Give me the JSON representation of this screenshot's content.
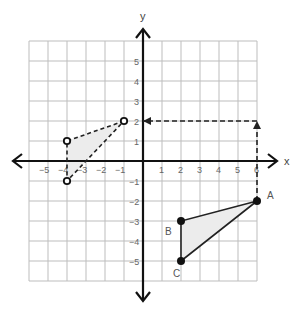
{
  "diagram": {
    "type": "coordinate-plane-translation",
    "axes": {
      "x_label": "x",
      "y_label": "y",
      "x_range": [
        -6,
        6
      ],
      "y_range": [
        -6,
        6
      ],
      "x_ticks": [
        -5,
        -4,
        -3,
        -2,
        -1,
        1,
        2,
        3,
        4,
        5,
        6
      ],
      "y_ticks": [
        -5,
        -4,
        -3,
        -2,
        -1,
        1,
        2,
        3,
        4,
        5
      ],
      "grid": true
    },
    "pixel_mapping": {
      "origin_x": 143,
      "origin_y": 161,
      "unit_x": 19,
      "unit_y": 20
    },
    "original_triangle": {
      "style": "solid",
      "points": [
        {
          "label": "A",
          "x": 6,
          "y": -2
        },
        {
          "label": "B",
          "x": 2,
          "y": -3
        },
        {
          "label": "C",
          "x": 2,
          "y": -5
        }
      ]
    },
    "image_triangle": {
      "style": "dashed",
      "points": [
        {
          "label": "",
          "x": -1,
          "y": 2
        },
        {
          "label": "",
          "x": -4,
          "y": 1
        },
        {
          "label": "",
          "x": -4,
          "y": -1
        }
      ]
    },
    "translation_path": {
      "style": "dashed",
      "description": "A moves up 4 then left 7",
      "points": [
        {
          "x": 6,
          "y": -2
        },
        {
          "x": 6,
          "y": 2
        },
        {
          "x": 0,
          "y": 2
        }
      ]
    },
    "colors": {
      "grid": "#bdbdbd",
      "axis": "#111111",
      "label": "#666666",
      "shade": "#ececec",
      "line": "#222222"
    }
  }
}
